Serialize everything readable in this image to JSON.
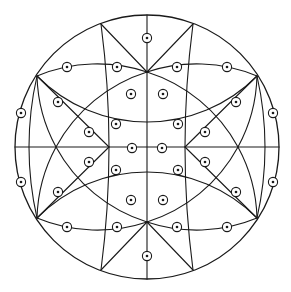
{
  "diagram": {
    "type": "stereographic-projection",
    "colors": {
      "line": "#1a1a1a",
      "background": "#ffffff"
    },
    "primitive": {
      "cx": 147,
      "cy": 147,
      "r": 132
    },
    "straight_lines": [
      [
        147,
        15,
        147,
        279
      ],
      [
        15,
        147,
        279,
        147
      ],
      [
        147,
        72,
        193,
        24
      ],
      [
        147,
        72,
        101,
        24
      ],
      [
        147,
        222,
        193,
        270
      ],
      [
        147,
        222,
        101,
        270
      ],
      [
        185,
        147,
        257,
        76
      ],
      [
        185,
        147,
        257,
        218
      ],
      [
        109,
        147,
        37,
        76
      ],
      [
        109,
        147,
        37,
        218
      ]
    ],
    "arcs": [
      [
        [
          193,
          24
        ],
        [
          185,
          147
        ],
        [
          193,
          270
        ]
      ],
      [
        [
          101,
          24
        ],
        [
          109,
          147
        ],
        [
          101,
          270
        ]
      ],
      [
        [
          37,
          76
        ],
        [
          147,
          122
        ],
        [
          257,
          76
        ]
      ],
      [
        [
          37,
          218
        ],
        [
          147,
          172
        ],
        [
          257,
          218
        ]
      ],
      [
        [
          147,
          72
        ],
        [
          238,
          147
        ],
        [
          257,
          218
        ]
      ],
      [
        [
          147,
          222
        ],
        [
          238,
          147
        ],
        [
          257,
          76
        ]
      ],
      [
        [
          147,
          72
        ],
        [
          56,
          147
        ],
        [
          37,
          218
        ]
      ],
      [
        [
          147,
          222
        ],
        [
          56,
          147
        ],
        [
          37,
          76
        ]
      ],
      [
        [
          257,
          76
        ],
        [
          265,
          147
        ],
        [
          257,
          218
        ]
      ],
      [
        [
          37,
          76
        ],
        [
          29,
          147
        ],
        [
          37,
          218
        ]
      ],
      [
        [
          147,
          72
        ],
        [
          202,
          64
        ],
        [
          257,
          76
        ]
      ],
      [
        [
          147,
          72
        ],
        [
          92,
          64
        ],
        [
          37,
          76
        ]
      ],
      [
        [
          147,
          222
        ],
        [
          202,
          230
        ],
        [
          257,
          218
        ]
      ],
      [
        [
          147,
          222
        ],
        [
          92,
          230
        ],
        [
          37,
          218
        ]
      ]
    ],
    "poles": [
      [
        147,
        38
      ],
      [
        147,
        256
      ],
      [
        177,
        67
      ],
      [
        227,
        67
      ],
      [
        117,
        67
      ],
      [
        67,
        67
      ],
      [
        177,
        227
      ],
      [
        227,
        227
      ],
      [
        117,
        227
      ],
      [
        67,
        227
      ],
      [
        273,
        113
      ],
      [
        273,
        182
      ],
      [
        21,
        113
      ],
      [
        21,
        182
      ],
      [
        236,
        102
      ],
      [
        236,
        192
      ],
      [
        58,
        102
      ],
      [
        58,
        192
      ],
      [
        163,
        94
      ],
      [
        163,
        200
      ],
      [
        131,
        94
      ],
      [
        131,
        200
      ],
      [
        178,
        124
      ],
      [
        178,
        170
      ],
      [
        116,
        124
      ],
      [
        116,
        170
      ],
      [
        205,
        132
      ],
      [
        205,
        162
      ],
      [
        89,
        132
      ],
      [
        89,
        162
      ],
      [
        162,
        148
      ],
      [
        132,
        148
      ]
    ],
    "pole_radius": 4.6,
    "dot_radius": 1.3
  }
}
